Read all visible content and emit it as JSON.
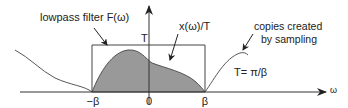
{
  "diagram": {
    "labels": {
      "filter": "lowpass filter F(ω)",
      "spectrum": "x(ω)/T",
      "copies_line1": "copies created",
      "copies_line2": "by sampling",
      "filter_height": "T",
      "period": "T= π/β",
      "neg_beta": "−β",
      "zero": "0",
      "pos_beta": "β",
      "x_axis": "ω"
    },
    "colors": {
      "line": "#333333",
      "fill": "#999999",
      "background": "#ffffff"
    },
    "elements": [
      "horizontal-axis-omega",
      "vertical-axis",
      "lowpass-filter-rectangle",
      "shaded-baseband-spectrum",
      "left-spectral-copy",
      "right-spectral-copy",
      "annotation-arrows"
    ]
  }
}
